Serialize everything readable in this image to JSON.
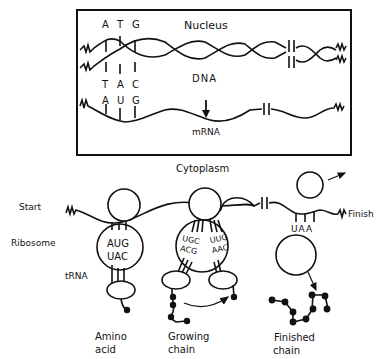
{
  "diagram": {
    "nucleus_box": {
      "title": "Nucleus",
      "dna_label": "DNA",
      "mrna_label": "mRNA",
      "top_strand_codon": [
        "A",
        "T",
        "G"
      ],
      "bottom_strand_codon": [
        "T",
        "A",
        "C"
      ],
      "mrna_codon": [
        "A",
        "U",
        "G"
      ]
    },
    "cytoplasm_label": "Cytoplasm",
    "side_labels": {
      "start": "Start",
      "ribosome": "Ribosome",
      "trna": "tRNA",
      "finish": "Finish"
    },
    "ribosome_1": {
      "codon": "AUG",
      "anticodon": "UAC"
    },
    "ribosome_2": {
      "left_codon": "UGC",
      "left_anticodon": "ACG",
      "right_codon": "UUG",
      "right_anticodon": "AAC"
    },
    "stop_codon": "UAA",
    "bottom_labels": {
      "amino_acid": [
        "Amino",
        "acid"
      ],
      "growing_chain": [
        "Growing",
        "chain"
      ],
      "finished_chain": [
        "Finished",
        "chain"
      ]
    },
    "colors": {
      "ink": "#111111",
      "background": "#ffffff"
    }
  }
}
